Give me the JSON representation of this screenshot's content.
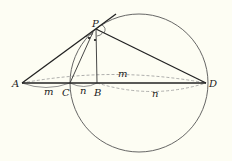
{
  "diagram": {
    "points": {
      "A": {
        "label": "A",
        "x": 22,
        "y": 83
      },
      "C": {
        "label": "C",
        "x": 70,
        "y": 83
      },
      "B": {
        "label": "B",
        "x": 97,
        "y": 83
      },
      "D": {
        "label": "D",
        "x": 206,
        "y": 83
      },
      "P": {
        "label": "P",
        "x": 96,
        "y": 29
      }
    },
    "circle": {
      "cx": 139,
      "cy": 83,
      "r": 69
    },
    "segment_labels": {
      "AD_upper": "m",
      "AC": "m",
      "CB": "n",
      "BD": "n"
    },
    "colors": {
      "background": "#fdfdf3",
      "line": "#222222",
      "dashed": "#999999"
    }
  }
}
